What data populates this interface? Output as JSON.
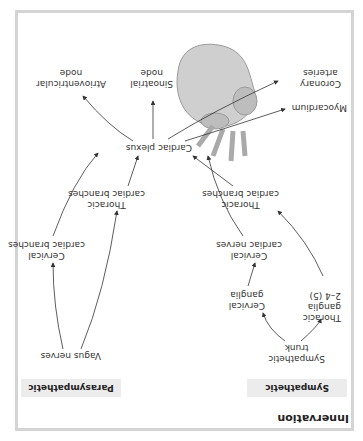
{
  "title": "Innervation",
  "headers": {
    "sympathetic": "Sympathetic",
    "parasympathetic": "Parasympathetic"
  },
  "nodes": {
    "sympathetic_trunk": [
      "Sympathetic",
      "trunk"
    ],
    "thoracic_ganglia": [
      "Thoracic",
      "ganglia",
      "2–4 (5)"
    ],
    "cervical_ganglia": [
      "Cervical",
      "ganglia"
    ],
    "thoracic_branches_symp": [
      "Thoracic",
      "cardiac branches"
    ],
    "cervical_nerves": [
      "Cervical",
      "cardiac nerves"
    ],
    "vagus_nerves": "Vagus nerves",
    "thoracic_branches_para": [
      "Thoracic",
      "cardiac branches"
    ],
    "cervical_branches_para": [
      "Cervical",
      "cardiac branches"
    ],
    "cardiac_plexus": "Cardiac plexus",
    "myocardium": "Myocardium",
    "coronary_arteries": [
      "Coronary",
      "arteries"
    ],
    "sinoatrial_node": [
      "Sinoatrial",
      "node"
    ],
    "av_node": [
      "Atrioventricular",
      "node"
    ]
  },
  "colors": {
    "frame": "#d4d4d4",
    "header_bg": "#ececec",
    "heart": "#bdbdbd",
    "arrow": "#333333"
  },
  "orientation": "rotated 180°"
}
